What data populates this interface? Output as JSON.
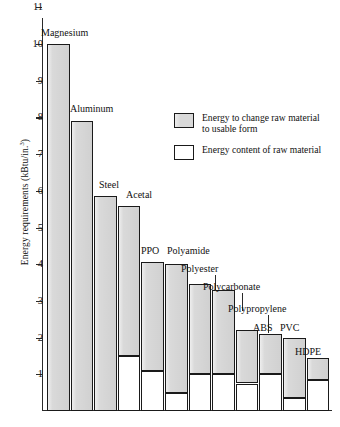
{
  "chart_data": {
    "type": "bar",
    "title": "",
    "subtitle": "",
    "xlabel": "",
    "ylabel": "Energy requirements (kBtu/in.3)",
    "ylabel_base": "Energy requirements (kBtu/in.",
    "ylabel_sup": "3",
    "ylabel_tail": ")",
    "ylim": [
      0,
      11
    ],
    "ytick_values": [
      1,
      2,
      3,
      4,
      5,
      6,
      7,
      8,
      9,
      10,
      11
    ],
    "ytick_labels": [
      "1",
      "2",
      "3",
      "4",
      "5",
      "6",
      "7",
      "8",
      "9",
      "10",
      "11"
    ],
    "grid": false,
    "stacked": true,
    "legend_position": "upper-right-inside",
    "categories": [
      "Magnesium",
      "Aluminum",
      "Steel",
      "Acetal",
      "PPO",
      "Polyamide",
      "Polyester",
      "Polycarbonate",
      "Polypropylene",
      "ABS",
      "PVC",
      "HDPE"
    ],
    "series": [
      {
        "name": "Energy content of raw material",
        "swatch": "white",
        "values": [
          0,
          0,
          0,
          1.5,
          1.1,
          0.5,
          1.0,
          1.0,
          0.75,
          1.0,
          0.35,
          0.85
        ]
      },
      {
        "name": "Energy to change raw material to usable form",
        "swatch": "gray",
        "values": [
          10.0,
          7.9,
          5.85,
          4.1,
          2.95,
          3.5,
          2.45,
          2.3,
          1.45,
          1.1,
          1.65,
          0.6
        ]
      }
    ],
    "totals": [
      10.0,
      7.9,
      5.85,
      5.6,
      4.05,
      4.0,
      3.45,
      3.3,
      2.2,
      2.1,
      2.0,
      1.45
    ]
  },
  "legend": {
    "items": [
      {
        "label_line1": "Energy to change raw material",
        "label_line2": "to usable form",
        "swatch": "gray"
      },
      {
        "label_line1": "Energy content of raw material",
        "label_line2": "",
        "swatch": "white"
      }
    ]
  },
  "bars": [
    {
      "label": "Magnesium",
      "x": 47.5,
      "w": 24.5,
      "total": 10.0,
      "split": 0,
      "label_x": 42,
      "label_y": 30,
      "leader": false
    },
    {
      "label": "Aluminum",
      "x": 76.5,
      "w": 24.5,
      "total": 7.9,
      "split": 0,
      "label_x": 71,
      "label_y": 107,
      "leader": false
    },
    {
      "label": "Steel",
      "x": 105.5,
      "w": 24.5,
      "total": 5.85,
      "split": 0,
      "label_x": 100,
      "label_y": 182,
      "leader": false
    },
    {
      "label": "Acetal",
      "x": 134.5,
      "w": 24.5,
      "total": 5.6,
      "split": 1.5,
      "label_x": 128,
      "label_y": 192,
      "leader": false
    },
    {
      "label": "PPO",
      "x": 163.5,
      "w": 24.5,
      "total": 4.05,
      "split": 1.1,
      "label_x": 163,
      "label_y": 248,
      "leader": false
    },
    {
      "label": "Polyamide",
      "x": 192.5,
      "w": 24.5,
      "total": 4.0,
      "split": 0.5,
      "label_x": 191,
      "label_y": 248,
      "leader": false
    },
    {
      "label": "Polyester",
      "x": 221.5,
      "w": 24.5,
      "total": 3.45,
      "split": 1.0,
      "label_x": 206,
      "label_y": 267,
      "leader": true
    },
    {
      "label": "Polycarbonate",
      "x": 250.5,
      "w": 24.5,
      "total": 3.3,
      "split": 1.0,
      "label_x": 233,
      "label_y": 285,
      "leader": true
    },
    {
      "label": "Polypropylene",
      "x": 279.5,
      "w": 24.5,
      "total": 2.2,
      "split": 0.75,
      "label_x": 230,
      "label_y": 306,
      "leader": true
    },
    {
      "label": "ABS",
      "x": 308.5,
      "w": 24.5,
      "total": 2.1,
      "split": 1.0,
      "label_x": 255,
      "label_y": 325,
      "leader": false
    },
    {
      "label": "PVC",
      "x": 337.5,
      "w": 24.5,
      "total": 2.0,
      "split": 0.35,
      "label_x": 283,
      "label_y": 325,
      "leader": false
    },
    {
      "label": "HDPE",
      "x": 366.5,
      "w": 24.5,
      "total": 1.45,
      "split": 0.85,
      "label_x": 297,
      "label_y": 350,
      "leader": false
    }
  ]
}
